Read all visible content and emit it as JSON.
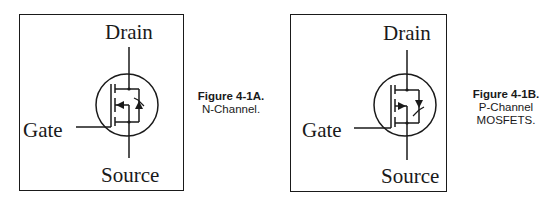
{
  "figures": [
    {
      "id": "4-1A",
      "figure_label": "Figure 4-1A.",
      "description_lines": [
        "N-Channel."
      ],
      "terminals": {
        "drain": "Drain",
        "gate": "Gate",
        "source": "Source"
      },
      "channel_type": "n-channel",
      "body_arrow": "pointing-inward"
    },
    {
      "id": "4-1B",
      "figure_label": "Figure 4-1B.",
      "description_lines": [
        "P-Channel",
        "MOSFETS."
      ],
      "terminals": {
        "drain": "Drain",
        "gate": "Gate",
        "source": "Source"
      },
      "channel_type": "p-channel",
      "body_arrow": "pointing-outward"
    }
  ],
  "colors": {
    "line": "#1a1a1a",
    "background": "#ffffff"
  }
}
